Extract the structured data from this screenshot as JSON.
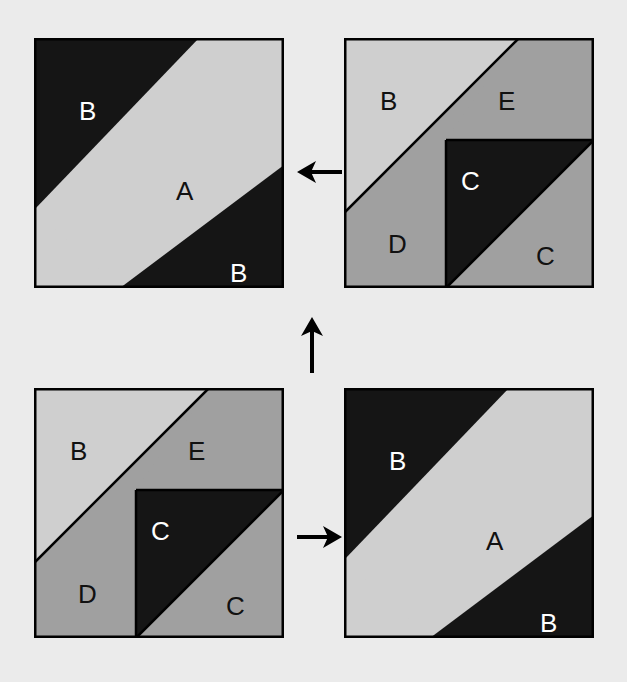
{
  "figure": {
    "background_color": "#ebebeb",
    "width": 627,
    "height": 682
  },
  "palette": {
    "dark": "#151515",
    "light": "#cfcfcf",
    "medium": "#a0a0a0",
    "outline": "#000000",
    "label_on_dark": "#ffffff",
    "label_on_light": "#111111"
  },
  "panels": [
    {
      "id": "top-left",
      "name": "panel-top-left",
      "kind": "band",
      "x": 34,
      "y": 38,
      "size": 250,
      "labels": [
        {
          "text": "B",
          "x": 45,
          "y": 60,
          "tone": "dark"
        },
        {
          "text": "A",
          "x": 142,
          "y": 140,
          "tone": "light"
        },
        {
          "text": "B",
          "x": 196,
          "y": 222,
          "tone": "dark"
        }
      ]
    },
    {
      "id": "top-right",
      "name": "panel-top-right",
      "kind": "pieces",
      "x": 344,
      "y": 38,
      "size": 250,
      "labels": [
        {
          "text": "B",
          "x": 36,
          "y": 50,
          "tone": "light"
        },
        {
          "text": "E",
          "x": 154,
          "y": 50,
          "tone": "light"
        },
        {
          "text": "C",
          "x": 117,
          "y": 130,
          "tone": "dark"
        },
        {
          "text": "D",
          "x": 44,
          "y": 193,
          "tone": "light"
        },
        {
          "text": "C",
          "x": 192,
          "y": 205,
          "tone": "light"
        }
      ]
    },
    {
      "id": "bottom-left",
      "name": "panel-bottom-left",
      "kind": "pieces",
      "x": 34,
      "y": 388,
      "size": 250,
      "labels": [
        {
          "text": "B",
          "x": 36,
          "y": 50,
          "tone": "light"
        },
        {
          "text": "E",
          "x": 154,
          "y": 50,
          "tone": "light"
        },
        {
          "text": "C",
          "x": 117,
          "y": 130,
          "tone": "dark"
        },
        {
          "text": "D",
          "x": 44,
          "y": 193,
          "tone": "light"
        },
        {
          "text": "C",
          "x": 192,
          "y": 205,
          "tone": "light"
        }
      ]
    },
    {
      "id": "bottom-right",
      "name": "panel-bottom-right",
      "kind": "band",
      "x": 344,
      "y": 388,
      "size": 250,
      "labels": [
        {
          "text": "B",
          "x": 45,
          "y": 60,
          "tone": "dark"
        },
        {
          "text": "A",
          "x": 142,
          "y": 140,
          "tone": "light"
        },
        {
          "text": "B",
          "x": 196,
          "y": 222,
          "tone": "dark"
        }
      ]
    }
  ],
  "arrows": [
    {
      "id": "arrow-left",
      "name": "arrow-right-to-left",
      "direction": "left",
      "x": 297,
      "y": 157,
      "width": 45,
      "height": 30
    },
    {
      "id": "arrow-up",
      "name": "arrow-bottom-to-top",
      "direction": "up",
      "x": 297,
      "y": 317,
      "width": 30,
      "height": 56
    },
    {
      "id": "arrow-right",
      "name": "arrow-left-to-right",
      "direction": "right",
      "x": 297,
      "y": 522,
      "width": 45,
      "height": 30
    }
  ],
  "geometry": {
    "band_note": "Light parallelogram band A crossing the square from upper-right to lower-left between two dark triangles labelled B",
    "pieces_note": "Square split into light triangle B, medium triangle E, dark triangle C, medium quad D and medium region C"
  }
}
